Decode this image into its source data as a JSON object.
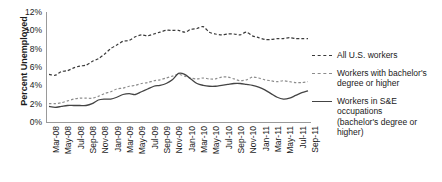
{
  "chart_data": {
    "type": "line",
    "title": "",
    "xlabel": "",
    "ylabel": "Percent Unemployed",
    "ylim": [
      0,
      12
    ],
    "yticks": [
      "0%",
      "2%",
      "4%",
      "6%",
      "8%",
      "10%",
      "12%"
    ],
    "ytick_values": [
      0,
      2,
      4,
      6,
      8,
      10,
      12
    ],
    "grid": false,
    "legend_position": "right",
    "x": [
      "Mar-08",
      "Apr-08",
      "May-08",
      "Jun-08",
      "Jul-08",
      "Aug-08",
      "Sep-08",
      "Oct-08",
      "Nov-08",
      "Dec-08",
      "Jan-09",
      "Feb-09",
      "Mar-09",
      "Apr-09",
      "May-09",
      "Jun-09",
      "Jul-09",
      "Aug-09",
      "Sep-09",
      "Oct-09",
      "Nov-09",
      "Dec-09",
      "Jan-10",
      "Feb-10",
      "Mar-10",
      "Apr-10",
      "May-10",
      "Jun-10",
      "Jul-10",
      "Aug-10",
      "Sep-10",
      "Oct-10",
      "Nov-10",
      "Dec-10",
      "Jan-11",
      "Feb-11",
      "Mar-11",
      "Apr-11",
      "May-11",
      "Jun-11",
      "Jul-11",
      "Aug-11",
      "Sep-11"
    ],
    "xtick_labels": [
      "Mar-08",
      "May-08",
      "Jul-08",
      "Sep-08",
      "Nov-08",
      "Jan-09",
      "Mar-09",
      "May-09",
      "Jul-09",
      "Sep-09",
      "Nov-09",
      "Jan-10",
      "Mar-10",
      "May-10",
      "Jul-10",
      "Sep-10",
      "Nov-10",
      "Jan-11",
      "Mar-11",
      "May-11",
      "Jul-11",
      "Sep-11"
    ],
    "series": [
      {
        "name": "All U.S. workers",
        "style": "dashed",
        "color": "#3a3a3a",
        "values": [
          5.2,
          5.1,
          5.5,
          5.6,
          5.9,
          6.1,
          6.2,
          6.6,
          6.9,
          7.4,
          8.0,
          8.4,
          8.8,
          8.9,
          9.3,
          9.5,
          9.4,
          9.6,
          9.8,
          10.0,
          10.0,
          10.0,
          9.8,
          10.1,
          10.2,
          10.4,
          9.8,
          9.6,
          9.5,
          9.6,
          9.6,
          9.5,
          9.8,
          9.4,
          9.2,
          9.0,
          9.0,
          9.1,
          9.1,
          9.2,
          9.1,
          9.1,
          9.1
        ]
      },
      {
        "name": "Workers with bachelor's degree or higher",
        "style": "dashed",
        "color": "#8c8c8c",
        "values": [
          2.0,
          2.0,
          2.1,
          2.3,
          2.5,
          2.6,
          2.6,
          2.6,
          2.8,
          3.1,
          3.3,
          3.6,
          3.7,
          3.9,
          4.0,
          4.2,
          4.3,
          4.5,
          4.6,
          4.8,
          5.0,
          5.2,
          5.0,
          4.8,
          4.7,
          4.8,
          4.7,
          4.7,
          4.9,
          4.9,
          4.7,
          4.5,
          4.6,
          4.9,
          4.8,
          4.6,
          4.5,
          4.4,
          4.5,
          4.4,
          4.3,
          4.3,
          4.4
        ]
      },
      {
        "name": "Workers in S&E occupations (bachelor's degree or higher)",
        "style": "solid",
        "color": "#444444",
        "values": [
          1.7,
          1.6,
          1.7,
          1.8,
          1.8,
          1.8,
          1.8,
          2.0,
          2.4,
          2.5,
          2.5,
          2.7,
          3.0,
          3.1,
          3.0,
          3.3,
          3.6,
          3.9,
          4.0,
          4.2,
          4.6,
          5.3,
          5.2,
          4.7,
          4.2,
          4.0,
          3.9,
          3.9,
          4.0,
          4.1,
          4.2,
          4.2,
          4.1,
          4.0,
          3.8,
          3.5,
          3.1,
          2.7,
          2.5,
          2.6,
          2.9,
          3.2,
          3.4
        ]
      }
    ]
  },
  "legend": {
    "items": [
      {
        "label_lines": [
          "All U.S. workers"
        ],
        "style": "dashed",
        "color": "#3a3a3a"
      },
      {
        "label_lines": [
          "Workers with bachelor's",
          "degree or higher"
        ],
        "style": "dashed",
        "color": "#8c8c8c"
      },
      {
        "label_lines": [
          "Workers in S&E occupations",
          "(bachelor's degree or higher)"
        ],
        "style": "solid",
        "color": "#444444"
      }
    ],
    "item0_line0": "All U.S. workers",
    "item1_line0": "Workers with bachelor's",
    "item1_line1": "degree or higher",
    "item2_line0": "Workers in S&E occupations",
    "item2_line1": "(bachelor's degree or higher)"
  },
  "axis": {
    "y_title": "Percent Unemployed"
  }
}
